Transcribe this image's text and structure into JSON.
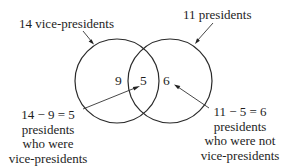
{
  "diagram": {
    "type": "venn",
    "sets": [
      {
        "id": "vice_presidents",
        "label": "14 vice-presidents",
        "total": 14,
        "only_count": 9
      },
      {
        "id": "presidents",
        "label": "11 presidents",
        "total": 11,
        "only_count": 6
      }
    ],
    "intersection_count": 5,
    "region_labels": {
      "left_only": "9",
      "overlap": "5",
      "right_only": "6"
    },
    "annotations": {
      "left": {
        "lines": [
          "14 − 9 = 5",
          "presidents",
          "who were",
          "vice-presidents"
        ]
      },
      "right": {
        "lines": [
          "11 − 5 = 6",
          "presidents",
          "who were not",
          "vice-presidents"
        ]
      }
    },
    "colors": {
      "stroke": "#2a2a2a",
      "text": "#1e1e1e",
      "background": "#ffffff"
    }
  }
}
